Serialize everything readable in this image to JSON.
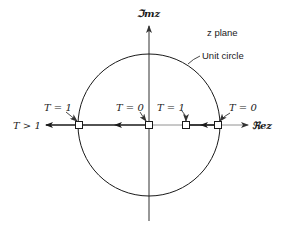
{
  "diagram": {
    "plane_label": "z plane",
    "circle_label": "Unit circle",
    "axes": {
      "real_label": "ℜez",
      "imag_label": "ℑmz"
    },
    "points": [
      {
        "id": "left-crossing",
        "label": "T = 1",
        "position": "z = -1"
      },
      {
        "id": "origin",
        "label": "T = 0",
        "position": "z = 0"
      },
      {
        "id": "inner-right",
        "label": "T = 1",
        "position": "z ≈ 0.5"
      },
      {
        "id": "right-crossing",
        "label": "T = 0",
        "position": "z = 1"
      }
    ],
    "locus_end_label": "T > 1",
    "colors": {
      "ink": "#1a1a1a",
      "thin_axis": "#555555",
      "background": "#ffffff"
    }
  }
}
